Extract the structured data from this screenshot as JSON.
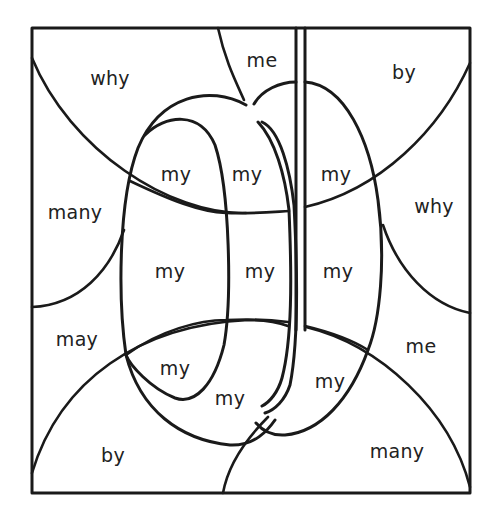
{
  "worksheet": {
    "subject": "yo-yo",
    "colors": {
      "ink": "#1a1a1a",
      "paper": "#ffffff",
      "text": "#222222"
    },
    "regions": [
      {
        "id": "r1",
        "word": "why",
        "x": 110,
        "y": 78
      },
      {
        "id": "r2",
        "word": "me",
        "x": 262,
        "y": 60
      },
      {
        "id": "r3",
        "word": "by",
        "x": 404,
        "y": 72
      },
      {
        "id": "r4",
        "word": "my",
        "x": 176,
        "y": 174
      },
      {
        "id": "r5",
        "word": "my",
        "x": 247,
        "y": 174
      },
      {
        "id": "r6",
        "word": "my",
        "x": 336,
        "y": 174
      },
      {
        "id": "r7",
        "word": "many",
        "x": 75,
        "y": 212
      },
      {
        "id": "r8",
        "word": "why",
        "x": 434,
        "y": 206
      },
      {
        "id": "r9",
        "word": "my",
        "x": 170,
        "y": 271
      },
      {
        "id": "r10",
        "word": "my",
        "x": 260,
        "y": 271
      },
      {
        "id": "r11",
        "word": "my",
        "x": 338,
        "y": 271
      },
      {
        "id": "r12",
        "word": "may",
        "x": 77,
        "y": 339
      },
      {
        "id": "r13",
        "word": "me",
        "x": 421,
        "y": 346
      },
      {
        "id": "r14",
        "word": "my",
        "x": 175,
        "y": 368
      },
      {
        "id": "r15",
        "word": "my",
        "x": 230,
        "y": 398
      },
      {
        "id": "r16",
        "word": "my",
        "x": 330,
        "y": 381
      },
      {
        "id": "r17",
        "word": "by",
        "x": 113,
        "y": 455
      },
      {
        "id": "r18",
        "word": "many",
        "x": 397,
        "y": 451
      }
    ]
  }
}
